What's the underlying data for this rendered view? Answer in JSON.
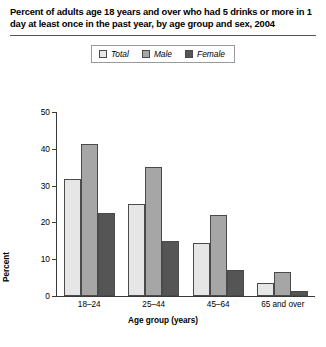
{
  "chart_data": {
    "type": "bar",
    "title": "Percent of adults age 18 years and over who had 5 drinks or more in 1 day at least once in the past year, by age group and sex, 2004",
    "xlabel": "Age group (years)",
    "ylabel": "Percent",
    "categories": [
      "18–24",
      "25–44",
      "45–64",
      "65 and over"
    ],
    "series": [
      {
        "name": "Total",
        "values": [
          31.8,
          25.0,
          14.4,
          3.5
        ],
        "color": "#e6e6e6"
      },
      {
        "name": "Male",
        "values": [
          41.3,
          35.0,
          22.0,
          6.5
        ],
        "color": "#a6a6a6"
      },
      {
        "name": "Female",
        "values": [
          22.5,
          15.0,
          7.0,
          1.3
        ],
        "color": "#555555"
      }
    ],
    "ylim": [
      0,
      50
    ],
    "yticks": [
      50,
      40,
      30,
      20,
      10,
      0
    ],
    "grid": false,
    "legend_position": "top-center"
  },
  "legend": {
    "items": [
      {
        "label": "Total"
      },
      {
        "label": "Male"
      },
      {
        "label": "Female"
      }
    ]
  }
}
